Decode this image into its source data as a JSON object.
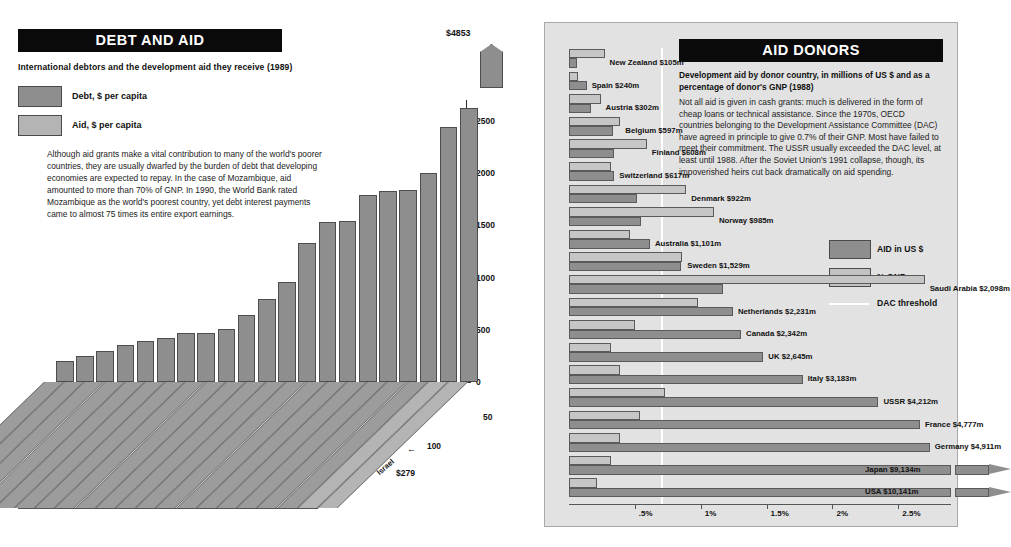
{
  "debt_panel": {
    "title": "DEBT AND AID",
    "subtitle": "International debtors and the development aid they receive (1989)",
    "legend": [
      {
        "key": "debt",
        "label": "Debt, $ per capita",
        "color": "#8e8e8e"
      },
      {
        "key": "aid",
        "label": "Aid, $ per capita",
        "color": "#b4b4b4"
      }
    ],
    "body": "Although aid grants make a vital contribution to many of the world's poorer countries, they are usually dwarfed by the burden of debt that developing economies are expected to repay. In the case of Mozambique, aid amounted to more than 70% of GNP.  In 1990, the World Bank rated Mozambique as the world's poorest country, yet debt interest payments came to almost 75 times its entire export earnings.",
    "top_value_label": "$4853",
    "israel_note": "$279",
    "aid_axis_note_50": "50",
    "aid_axis_note_100": "100"
  },
  "donors_panel": {
    "title": "AID DONORS",
    "subtitle": "Development aid by donor country, in millions of US $ and as a percentage of donor's GNP (1988)",
    "body": "Not all aid is given in cash grants: much is delivered in the form of cheap loans or technical assistance. Since the 1970s, OECD countries belonging to the Development Assistance Committee (DAC) have agreed in principle to give 0.7% of their GNP. Most have failed to meet their commitment. The USSR usually exceeded the DAC level, at least until 1988.  After the Soviet Union's 1991 collapse, though, its impoverished heirs cut back dramatically on aid spending.",
    "legend": [
      {
        "key": "aid_us",
        "label": "AID in US $",
        "color": "#8e8e8e"
      },
      {
        "key": "pct_gnp",
        "label": "% GNP",
        "color": "#c6c6c6"
      },
      {
        "key": "dac",
        "label": "DAC threshold",
        "color": "#ffffff"
      }
    ]
  },
  "chart_data": [
    {
      "type": "bar",
      "id": "debt-and-aid",
      "title": "DEBT AND AID",
      "subtitle": "International debtors and the development aid they receive (1989)",
      "xlabel": "",
      "ylabel": "Debt, $ per capita",
      "ylim": [
        0,
        2700
      ],
      "yticks": [
        0,
        500,
        1000,
        1500,
        2000,
        2500
      ],
      "grid": false,
      "legend_position": "top-left",
      "note": "Final bar (Israel) is broken; true value $4853. Aid axis runs along the depth direction with ticks at 50 and 100 $ per capita.",
      "categories": [
        "Lesotho",
        "Central African R.",
        "Niger",
        "Mali",
        "Mozambique",
        "Somalia",
        "Togo",
        "El Salvador",
        "Botswana",
        "Papua New Guinea",
        "Senegal",
        "Honduras",
        "Mauritius",
        "Bolivia",
        "Zambia",
        "Mauritania",
        "Jordan",
        "Costa Rica",
        "Jamaica",
        "Gabon",
        "Israel"
      ],
      "series": [
        {
          "name": "Debt, $ per capita",
          "color": "#8e8e8e",
          "values": [
            205,
            250,
            300,
            350,
            395,
            420,
            470,
            470,
            505,
            640,
            790,
            960,
            1330,
            1530,
            1540,
            1790,
            1830,
            1840,
            2000,
            2440,
            4853
          ]
        },
        {
          "name": "Aid, $ per capita",
          "color": "#b4b4b4",
          "values": [
            null,
            null,
            null,
            null,
            null,
            null,
            null,
            null,
            null,
            null,
            null,
            null,
            null,
            null,
            null,
            null,
            null,
            null,
            null,
            100,
            279
          ]
        }
      ],
      "data_labels": {
        "Israel": "$4853",
        "Gabon": "$279"
      }
    },
    {
      "type": "bar",
      "id": "aid-donors",
      "orientation": "horizontal",
      "title": "AID DONORS",
      "subtitle": "Development aid by donor country, in millions of US $ and as a percentage of donor's GNP (1988)",
      "xlabel": "% GNP",
      "xticks": [
        0.5,
        1.0,
        1.5,
        2.0,
        2.5
      ],
      "xtick_labels": [
        ".5%",
        "1%",
        "1.5%",
        "2%",
        "2.5%"
      ],
      "xlim": [
        0,
        2.9
      ],
      "grid": false,
      "dac_threshold_pct": 0.7,
      "legend_position": "right",
      "legend_entries": [
        "AID in US $",
        "% GNP",
        "DAC threshold"
      ],
      "categories": [
        "New Zealand",
        "Spain",
        "Austria",
        "Belgium",
        "Finland",
        "Switzerland",
        "Denmark",
        "Norway",
        "Australia",
        "Sweden",
        "Saudi Arabia",
        "Netherlands",
        "Canada",
        "UK",
        "Italy",
        "USSR",
        "France",
        "Germany",
        "Japan",
        "USA"
      ],
      "series": [
        {
          "name": "AID in US $",
          "unit": "millions of US $",
          "color": "#8e8e8e",
          "values": [
            105,
            240,
            302,
            597,
            608,
            617,
            922,
            985,
            1101,
            1529,
            2098,
            2231,
            2342,
            2645,
            3183,
            4212,
            4777,
            4911,
            9134,
            10141
          ]
        },
        {
          "name": "% GNP",
          "unit": "percent of donor GNP",
          "color": "#c6c6c6",
          "values": [
            0.27,
            0.07,
            0.24,
            0.39,
            0.59,
            0.32,
            0.89,
            1.1,
            0.46,
            0.86,
            2.7,
            0.98,
            0.5,
            0.32,
            0.39,
            0.73,
            0.54,
            0.39,
            0.32,
            0.21
          ]
        }
      ],
      "labels": [
        "New Zealand $105m",
        "Spain $240m",
        "Austria $302m",
        "Belgium $597m",
        "Finland $608m",
        "Switzerland $617m",
        "Denmark $922m",
        "Norway $985m",
        "Australia $1,101m",
        "Sweden $1,529m",
        "Saudi Arabia $2,098m",
        "Netherlands $2,231m",
        "Canada $2,342m",
        "UK $2,645m",
        "Italy $3,183m",
        "USSR $4,212m",
        "France $4,777m",
        "Germany $4,911m",
        "Japan $9,134m",
        "USA $10,141m"
      ],
      "broken_bars": [
        "Japan",
        "USA"
      ]
    }
  ]
}
